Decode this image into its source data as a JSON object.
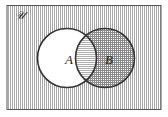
{
  "diagram": {
    "type": "venn",
    "universe_label": "𝒰",
    "sets": [
      {
        "label": "A",
        "shaded": false
      },
      {
        "label": "B",
        "shaded": true
      }
    ],
    "shaded_region": "complement of (A minus B) — universe outside A plus B",
    "colors": {
      "outline": "#333333",
      "shade": "#9a9a9a",
      "background": "#ffffff"
    }
  }
}
